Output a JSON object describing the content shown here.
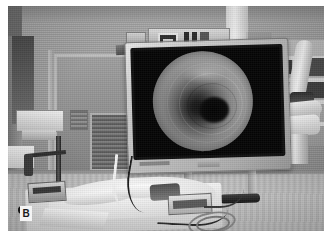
{
  "figure": {
    "panel_letter": "B",
    "caption_alt": "Operating room during bronchoscopy: video monitor displays circular endoscopic view of airway lumen; draped patient on operating table, articulated surgical arm at right, IV pole at left, door with vision panel in background."
  },
  "scene": {
    "modality": "grayscale-photograph",
    "setting": "operating-room",
    "elements": [
      {
        "name": "endoscopy-monitor",
        "note": "large flat-panel display, light gray bezel, tilted slightly"
      },
      {
        "name": "endoscopic-image",
        "note": "circular lumen view, dark central opening, mucosal folds"
      },
      {
        "name": "video-tower-equipment",
        "note": "stacked equipment shelf above monitor"
      },
      {
        "name": "surgical-arm",
        "note": "articulated ceiling/boom arm at right"
      },
      {
        "name": "equipment-rack",
        "note": "shelving with supplies at far right"
      },
      {
        "name": "iv-pole",
        "note": "rolling stand with five-caster base at left"
      },
      {
        "name": "operating-table",
        "note": "patient covered with surgical drapes"
      },
      {
        "name": "tubing",
        "note": "ventilator / suction tubing crossing the field"
      },
      {
        "name": "door",
        "note": "door with rectangular vision window and overhead closer"
      },
      {
        "name": "wall-switch-plate",
        "note": "outlet / switch plate on back wall"
      }
    ]
  },
  "colors": {
    "background": "#ffffff",
    "wall": "#a2a2a2",
    "floor": "#c4c4c4",
    "monitor_bezel": "#c9c9c9",
    "screen_black": "#060606",
    "drape_white": "#f2f2f2",
    "label_background": "#f4f4f4",
    "label_text": "#1a1a1a"
  }
}
